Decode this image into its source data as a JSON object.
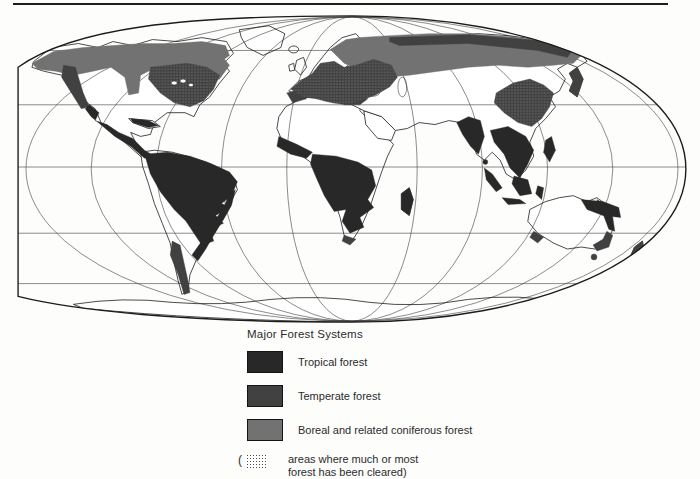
{
  "palette": {
    "tropical": "#282828",
    "temperate": "#414141",
    "boreal": "#727272",
    "line": "#1c1c1c",
    "stippleDot": "#4a4a4a",
    "pageBg": "#fdfdfc"
  },
  "legend": {
    "title": "Major Forest Systems",
    "items": [
      {
        "label": "Tropical forest"
      },
      {
        "label": "Temperate forest"
      },
      {
        "label": "Boreal and related coniferous forest"
      }
    ],
    "cleared_note": {
      "open_paren": "(",
      "line1": "areas where much or most",
      "line2": "forest has been cleared)"
    }
  }
}
